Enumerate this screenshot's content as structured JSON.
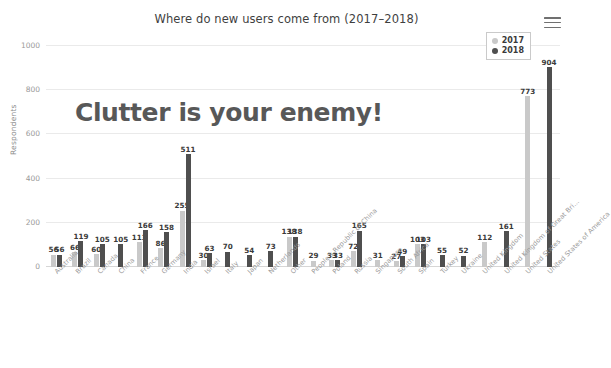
{
  "chart_data": {
    "type": "bar",
    "title": "Where do new users come from (2017–2018)",
    "xlabel": "",
    "ylabel": "Respondents",
    "ylim": [
      0,
      1000
    ],
    "yticks": [
      0,
      200,
      400,
      600,
      800,
      1000
    ],
    "grid": true,
    "legend_position": "top-right",
    "categories": [
      "Australia",
      "Brazil",
      "Canada",
      "China",
      "France",
      "Germany",
      "India",
      "Israel",
      "Italy",
      "Japan",
      "Netherlands",
      "Other",
      "People's Republic of China",
      "Poland",
      "Russia",
      "Singapore",
      "South Africa",
      "Spain",
      "Turkey",
      "Ukraine",
      "United Kingdom",
      "United Kingdom of Great Bri...",
      "United States",
      "United States of America"
    ],
    "series": [
      {
        "name": "2017",
        "color": "#c9c9c9",
        "values": [
          56,
          66,
          60,
          null,
          113,
          86,
          255,
          30,
          null,
          null,
          null,
          138,
          29,
          33,
          72,
          31,
          27,
          103,
          null,
          null,
          112,
          null,
          773,
          null
        ]
      },
      {
        "name": "2018",
        "color": "#4f4f4f",
        "values": [
          56,
          119,
          105,
          105,
          166,
          158,
          511,
          63,
          70,
          54,
          73,
          138,
          null,
          33,
          165,
          null,
          49,
          103,
          55,
          52,
          null,
          161,
          null,
          904
        ]
      }
    ],
    "annotation": "Clutter is your enemy!"
  },
  "header": {
    "title": "Where do new users come from (2017–2018)",
    "menu_icon": "hamburger-menu-icon"
  },
  "legend": {
    "items": [
      {
        "label": "2017",
        "color": "#c9c9c9"
      },
      {
        "label": "2018",
        "color": "#4f4f4f"
      }
    ]
  },
  "axes": {
    "y_title": "Respondents",
    "y_ticks": [
      "0",
      "200",
      "400",
      "600",
      "800",
      "1000"
    ]
  },
  "annotation": {
    "text": "Clutter is your enemy!"
  },
  "colors": {
    "series_2017": "#c9c9c9",
    "series_2018": "#4f4f4f",
    "grid": "#eaeaea",
    "axis": "#d6d6d6",
    "title_text": "#3f3f3f",
    "tick_text": "#9a9a9a",
    "annotation_text": "#585858"
  }
}
